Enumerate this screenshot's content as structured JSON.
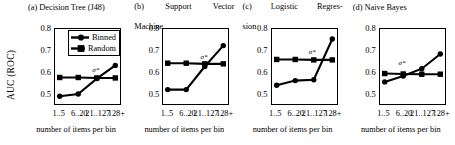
{
  "figure": {
    "ylabel": "AUC (ROC)",
    "xlabel": "number of items per bin",
    "legend": {
      "binned": "Binned",
      "random": "Random"
    },
    "annotation": "σ*",
    "colors": {
      "line": "#000000",
      "background": "#ffffff",
      "axis": "#000000"
    }
  },
  "chart_data": [
    {
      "type": "line",
      "title": "(a) Decision Tree (J48)",
      "xlabel": "number of items per bin",
      "ylabel": "AUC (ROC)",
      "categories": [
        "1..5",
        "6..20",
        "21..127",
        "128+"
      ],
      "ylim": [
        0.45,
        0.8
      ],
      "yticks": [
        0.5,
        0.6,
        0.7,
        0.8
      ],
      "ytick_labels": [
        "0.5",
        "0.6",
        "0.7",
        "0.8"
      ],
      "grid": false,
      "legend_position": "upper-right-inside",
      "annotations": [
        {
          "text": "σ*",
          "x": "21..127",
          "y": 0.572
        }
      ],
      "series": [
        {
          "name": "Binned",
          "marker": "circle",
          "values": [
            0.49,
            0.5,
            0.57,
            0.63
          ]
        },
        {
          "name": "Random",
          "marker": "square",
          "values": [
            0.575,
            0.575,
            0.573,
            0.573
          ]
        }
      ]
    },
    {
      "type": "line",
      "title": "(b) Support Vector Machine",
      "xlabel": "number of items per bin",
      "ylabel": "AUC (ROC)",
      "categories": [
        "1..5",
        "6..20",
        "21..127",
        "128+"
      ],
      "ylim": [
        0.45,
        0.8
      ],
      "yticks": [
        0.5,
        0.6,
        0.7,
        0.8
      ],
      "ytick_labels": [
        "0.5",
        "0.6",
        "0.7",
        "0.8"
      ],
      "grid": false,
      "legend_position": "none",
      "annotations": [
        {
          "text": "σ*",
          "x": "21..127",
          "y": 0.63
        }
      ],
      "series": [
        {
          "name": "Binned",
          "marker": "circle",
          "values": [
            0.52,
            0.52,
            0.625,
            0.72
          ]
        },
        {
          "name": "Random",
          "marker": "square",
          "values": [
            0.64,
            0.64,
            0.637,
            0.637
          ]
        }
      ]
    },
    {
      "type": "line",
      "title": "(c) Logistic Regression",
      "xlabel": "number of items per bin",
      "ylabel": "AUC (ROC)",
      "categories": [
        "1..5",
        "6..20",
        "21..127",
        "128+"
      ],
      "ylim": [
        0.45,
        0.8
      ],
      "yticks": [
        0.5,
        0.6,
        0.7,
        0.8
      ],
      "ytick_labels": [
        "0.5",
        "0.6",
        "0.7",
        "0.8"
      ],
      "grid": false,
      "legend_position": "none",
      "annotations": [
        {
          "text": "σ*",
          "x": "21..127",
          "y": 0.655
        }
      ],
      "series": [
        {
          "name": "Binned",
          "marker": "circle",
          "values": [
            0.54,
            0.561,
            0.565,
            0.75
          ]
        },
        {
          "name": "Random",
          "marker": "square",
          "values": [
            0.657,
            0.657,
            0.655,
            0.655
          ]
        }
      ]
    },
    {
      "type": "line",
      "title": "(d) Naive Bayes",
      "xlabel": "number of items per bin",
      "ylabel": "AUC (ROC)",
      "categories": [
        "1..5",
        "6..20",
        "21..127",
        "128+"
      ],
      "ylim": [
        0.45,
        0.8
      ],
      "yticks": [
        0.5,
        0.6,
        0.7,
        0.8
      ],
      "ytick_labels": [
        "0.5",
        "0.6",
        "0.7",
        "0.8"
      ],
      "grid": false,
      "legend_position": "none",
      "annotations": [
        {
          "text": "σ*",
          "x": "6..20",
          "y": 0.605
        }
      ],
      "series": [
        {
          "name": "Binned",
          "marker": "circle",
          "values": [
            0.555,
            0.582,
            0.615,
            0.682
          ]
        },
        {
          "name": "Random",
          "marker": "square",
          "values": [
            0.593,
            0.591,
            0.59,
            0.59
          ]
        }
      ]
    }
  ],
  "panel_titles": {
    "a": "(a) Decision Tree (J48)",
    "b_line1": "(b)",
    "b_line1b": "Support",
    "b_line1c": "Vector",
    "b_line2": "Machine",
    "c_line1": "(c)",
    "c_line1b": "Logistic",
    "c_line1c": "Regres-",
    "c_line2": "sion",
    "d": "(d) Naive Bayes"
  }
}
